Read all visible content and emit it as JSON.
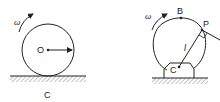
{
  "figures": [
    {
      "name": "rolling-wheel",
      "labels": {
        "angular_velocity": "ω",
        "center": "O",
        "caption": "C"
      }
    },
    {
      "name": "rotating-wheel-on-support",
      "labels": {
        "angular_velocity": "ω",
        "top_point": "B",
        "point": "P",
        "length": "l",
        "center": "C"
      }
    }
  ],
  "colors": {
    "stroke": "#222222",
    "hatch": "#888888"
  }
}
